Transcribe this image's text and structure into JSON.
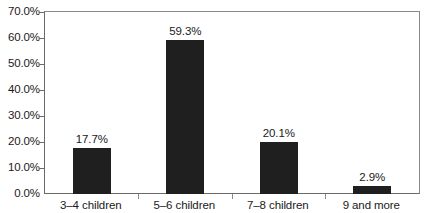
{
  "chart_data": {
    "type": "bar",
    "title": "",
    "subtitle": "",
    "xlabel": "",
    "ylabel": "",
    "categories": [
      "3–4 children",
      "5–6 children",
      "7–8 children",
      "9 and more"
    ],
    "values": [
      17.7,
      59.3,
      20.1,
      2.9
    ],
    "data_labels": [
      "17.7%",
      "59.3%",
      "20.1%",
      "2.9%"
    ],
    "ylim": [
      0,
      70
    ],
    "ytick_values": [
      0,
      10,
      20,
      30,
      40,
      50,
      60,
      70
    ],
    "ytick_labels": [
      "0.0%",
      "10.0%",
      "20.0%",
      "30.0%",
      "40.0%",
      "50.0%",
      "60.0%",
      "70.0%"
    ],
    "grid": false,
    "legend": null,
    "legend_position": "none",
    "bar_color": "#1f1f1f",
    "axis_color": "#6b6b6b",
    "frame_color": "#8a8a8a",
    "background_color": "#ffffff",
    "text_color": "#1a1a1a",
    "series": [
      {
        "name": "Share of households",
        "values": [
          17.7,
          59.3,
          20.1,
          2.9
        ]
      }
    ]
  }
}
